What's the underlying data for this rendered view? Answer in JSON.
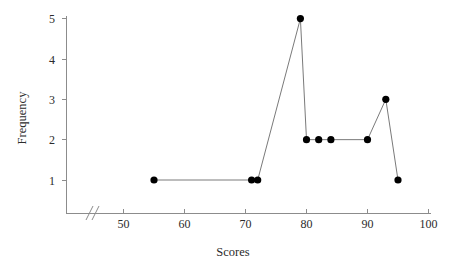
{
  "chart_data": {
    "type": "line",
    "title": "",
    "xlabel": "Scores",
    "ylabel": "Frequency",
    "x": [
      55,
      71,
      72,
      79,
      80,
      82,
      84,
      90,
      93,
      95
    ],
    "values": [
      1,
      1,
      1,
      5,
      2,
      2,
      2,
      2,
      3,
      1
    ],
    "points": [
      {
        "x": 55,
        "y": 1
      },
      {
        "x": 71,
        "y": 1
      },
      {
        "x": 72,
        "y": 1
      },
      {
        "x": 79,
        "y": 5
      },
      {
        "x": 80,
        "y": 2
      },
      {
        "x": 82,
        "y": 2
      },
      {
        "x": 84,
        "y": 2
      },
      {
        "x": 90,
        "y": 2
      },
      {
        "x": 93,
        "y": 3
      },
      {
        "x": 95,
        "y": 1
      }
    ],
    "xticks": [
      50,
      60,
      70,
      80,
      90,
      100
    ],
    "xtick_labels": [
      "50",
      "60",
      "70",
      "80",
      "90",
      "100"
    ],
    "yticks": [
      1,
      2,
      3,
      4,
      5
    ],
    "ytick_labels": [
      "1",
      "2",
      "3",
      "4",
      "5"
    ],
    "xlim": [
      46,
      100
    ],
    "ylim": [
      0.2,
      5
    ],
    "grid": false,
    "legend": null,
    "axis_break": {
      "axis": "x",
      "symbol": "//",
      "position": 47.5
    },
    "marker": "filled-circle",
    "marker_color": "#000000",
    "line_color": "#7a7a7a",
    "axis_color": "#8c8c8c",
    "background_color": "#ffffff"
  }
}
